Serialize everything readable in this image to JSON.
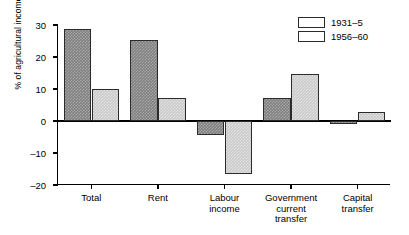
{
  "chart_data": {
    "type": "bar",
    "title": "",
    "xlabel": "",
    "ylabel": "% of agricultural income",
    "ylim": [
      -20,
      30
    ],
    "yticks": [
      30,
      20,
      10,
      0,
      -10,
      -20
    ],
    "ytick_labels": [
      "30",
      "20",
      "10",
      "0",
      "–10",
      "–20"
    ],
    "grid": false,
    "legend_position": "top-right",
    "categories": [
      "Total",
      "Rent",
      "Labour\nincome",
      "Government\ncurrent\ntransfer",
      "Capital\ntransfer"
    ],
    "series": [
      {
        "name": "1931–5",
        "color": "#7e7e7e",
        "values": [
          28.7,
          25.4,
          -4.3,
          7.3,
          -1.0
        ]
      },
      {
        "name": "1956–60",
        "color": "#c9c9c9",
        "values": [
          10.1,
          7.3,
          -16.5,
          14.8,
          2.7
        ]
      }
    ]
  }
}
